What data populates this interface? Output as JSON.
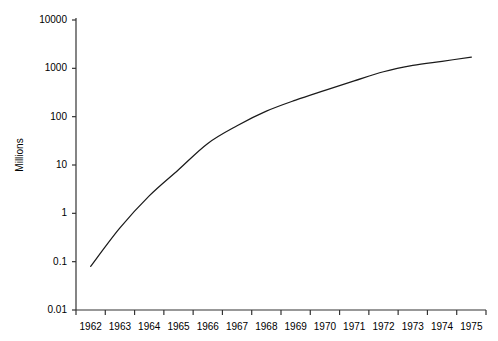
{
  "chart_data": {
    "type": "line",
    "title": "",
    "xlabel": "",
    "ylabel": "Millions",
    "yscale": "log",
    "ylim": [
      0.01,
      10000
    ],
    "xlim": [
      1962,
      1975
    ],
    "grid": false,
    "legend": null,
    "y_ticks": [
      "10000",
      "1000",
      "100",
      "10",
      "1",
      "0.1",
      "0.01"
    ],
    "y_tick_values": [
      10000,
      1000,
      100,
      10,
      1,
      0.1,
      0.01
    ],
    "x_ticks": [
      "1962",
      "1963",
      "1964",
      "1965",
      "1966",
      "1967",
      "1968",
      "1969",
      "1970",
      "1971",
      "1972",
      "1973",
      "1974",
      "1975"
    ],
    "x": [
      1962,
      1963,
      1964,
      1965,
      1966,
      1967,
      1968,
      1969,
      1970,
      1971,
      1972,
      1973,
      1974,
      1975
    ],
    "values": [
      0.08,
      0.5,
      2.3,
      8,
      28,
      65,
      130,
      220,
      350,
      550,
      850,
      1150,
      1400,
      1700
    ],
    "series": [
      {
        "name": "Millions",
        "color": "#1a1a1a",
        "values": [
          0.08,
          0.5,
          2.3,
          8,
          28,
          65,
          130,
          220,
          350,
          550,
          850,
          1150,
          1400,
          1700
        ]
      }
    ]
  },
  "axes": {
    "line_color": "#333333",
    "text_color": "#000000",
    "background": "#ffffff"
  }
}
